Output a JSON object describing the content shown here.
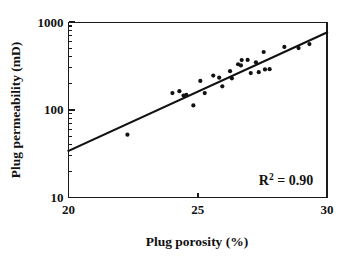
{
  "chart_data": {
    "type": "scatter",
    "title": "",
    "xlabel": "Plug porosity (%)",
    "ylabel": "Plug permeability (mD)",
    "xlim": [
      20,
      30
    ],
    "ylim": [
      10,
      1000
    ],
    "yscale": "log",
    "xscale": "linear",
    "grid": false,
    "legend": null,
    "xticks": [
      "20",
      "25",
      "30"
    ],
    "xtick_values": [
      20,
      25,
      30
    ],
    "yticks": [
      "10",
      "100",
      "1000"
    ],
    "ytick_values": [
      10,
      100,
      1000
    ],
    "annotations": [
      {
        "name": "r-squared",
        "base": "R",
        "superscript": "2",
        "rest": " = 0.90",
        "text": "R2 = 0.90",
        "x": 28.3,
        "y": 26
      }
    ],
    "series": [
      {
        "name": "plug measurements",
        "marker": "circle",
        "color": "#111111",
        "points": [
          {
            "x": 22.28,
            "y": 52
          },
          {
            "x": 24.02,
            "y": 155
          },
          {
            "x": 24.29,
            "y": 163
          },
          {
            "x": 24.45,
            "y": 145
          },
          {
            "x": 24.56,
            "y": 148
          },
          {
            "x": 24.83,
            "y": 112
          },
          {
            "x": 25.1,
            "y": 213
          },
          {
            "x": 25.27,
            "y": 155
          },
          {
            "x": 25.6,
            "y": 245
          },
          {
            "x": 25.83,
            "y": 232
          },
          {
            "x": 25.95,
            "y": 185
          },
          {
            "x": 26.25,
            "y": 275
          },
          {
            "x": 26.32,
            "y": 228
          },
          {
            "x": 26.56,
            "y": 330
          },
          {
            "x": 26.67,
            "y": 320
          },
          {
            "x": 26.7,
            "y": 368
          },
          {
            "x": 26.93,
            "y": 370
          },
          {
            "x": 27.05,
            "y": 262
          },
          {
            "x": 27.25,
            "y": 348
          },
          {
            "x": 27.36,
            "y": 268
          },
          {
            "x": 27.55,
            "y": 455
          },
          {
            "x": 27.6,
            "y": 288
          },
          {
            "x": 27.78,
            "y": 290
          },
          {
            "x": 28.35,
            "y": 520
          },
          {
            "x": 28.9,
            "y": 505
          },
          {
            "x": 29.32,
            "y": 560
          }
        ]
      }
    ],
    "fit_line": {
      "name": "regression-line",
      "color": "#111111",
      "x_start": 20.0,
      "y_start": 34,
      "x_end": 30.0,
      "y_end": 760
    }
  },
  "axes": {
    "x_title": "Plug porosity (%)",
    "y_title": "Plug permeability (mD)"
  }
}
